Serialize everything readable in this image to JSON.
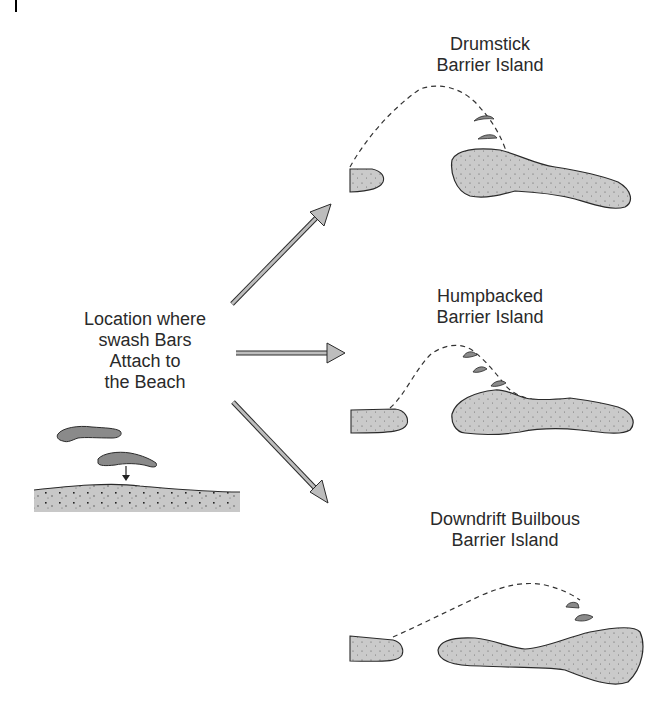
{
  "labels": {
    "source": [
      "Location where",
      "swash Bars",
      "Attach to",
      "the Beach"
    ],
    "drumstick": [
      "Drumstick",
      "Barrier Island"
    ],
    "humpbacked": [
      "Humpbacked",
      "Barrier Island"
    ],
    "downdrift": [
      "Downdrift Builbous",
      "Barrier Island"
    ]
  },
  "colors": {
    "sand_fill": "#c9c9c9",
    "bar_fill": "#8a8a8a",
    "outline": "#2a2a2a",
    "arrow_fill": "#bdbdbd",
    "text": "#2a2a2a"
  },
  "arrows": [
    {
      "name": "to-drumstick",
      "direction": "up-right"
    },
    {
      "name": "to-humpbacked",
      "direction": "right"
    },
    {
      "name": "to-downdrift",
      "direction": "down-right"
    }
  ]
}
